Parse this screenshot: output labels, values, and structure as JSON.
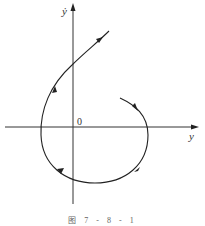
{
  "diagram": {
    "type": "phase-portrait",
    "axes": {
      "x_label": "y",
      "y_label": "ẏ",
      "origin_label": "0"
    },
    "trajectory": {
      "description": "Spiral trajectory starting right of y-axis above x-axis, moving clockwise around the origin and escaping upward-right",
      "direction_arrows": 5
    },
    "caption": "图 7 - 8 - 1",
    "colors": {
      "line": "#222222",
      "axis": "#333333"
    }
  }
}
